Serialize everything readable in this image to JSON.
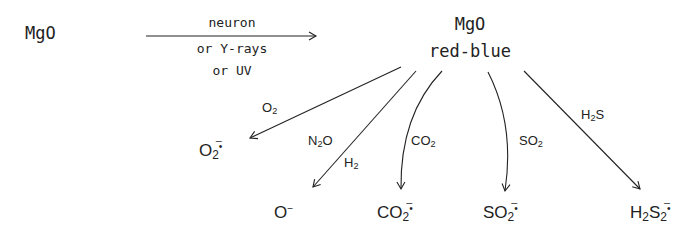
{
  "diagram": {
    "start": {
      "label": "MgO"
    },
    "main_arrow": {
      "conditions": [
        "neuron",
        "or Y-rays",
        "or UV"
      ]
    },
    "center": {
      "line1": "MgO",
      "line2": "red-blue"
    },
    "branches": [
      {
        "reagent": "O",
        "reagent_sub": "2",
        "product": "O",
        "product_sub": "2",
        "product_sup": "̅•",
        "path": "straight"
      },
      {
        "reagent": "N",
        "reagent_sub": "2",
        "reagent_tail": "O",
        "reagent2": "H",
        "reagent2_sub": "2",
        "product": "O",
        "product_sup": "−",
        "path": "straight"
      },
      {
        "reagent": "CO",
        "reagent_sub": "2",
        "product": "CO",
        "product_sub": "2",
        "product_sup": "̅•",
        "path": "curved"
      },
      {
        "reagent": "SO",
        "reagent_sub": "2",
        "product": "SO",
        "product_sub": "2",
        "product_sup": "̅•",
        "path": "curved"
      },
      {
        "reagent": "H",
        "reagent_sub": "2",
        "reagent_tail": "S",
        "product": "H",
        "product_sub": "2",
        "product_mid": "S",
        "product_sub2": "2",
        "product_sup": "̅•",
        "path": "straight"
      }
    ]
  },
  "colors": {
    "ink": "#222222",
    "background": "#ffffff"
  }
}
